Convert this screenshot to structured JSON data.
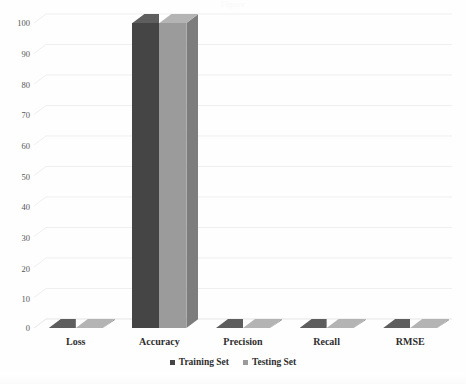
{
  "chart_data": {
    "type": "bar",
    "title": "Figure",
    "xlabel": "",
    "ylabel": "",
    "ylim": [
      0,
      100
    ],
    "ytick_labels": [
      "100",
      "90",
      "80",
      "70",
      "60",
      "50",
      "40",
      "30",
      "20",
      "10",
      "0"
    ],
    "ytick_values": [
      100,
      90,
      80,
      70,
      60,
      50,
      40,
      30,
      20,
      10,
      0
    ],
    "categories": [
      "Loss",
      "Accuracy",
      "Precision",
      "Recall",
      "RMSE"
    ],
    "grid": true,
    "legend_position": "bottom",
    "style": "3d-column",
    "series": [
      {
        "name": "Training Set",
        "color": "#454545",
        "values": [
          0,
          100,
          0,
          0,
          0
        ]
      },
      {
        "name": "Testing Set",
        "color": "#9b9b9b",
        "values": [
          0,
          100,
          0,
          0,
          0
        ]
      }
    ]
  },
  "axis": {
    "y_labels": [
      {
        "text": "100",
        "value": 100
      },
      {
        "text": "90",
        "value": 90
      },
      {
        "text": "80",
        "value": 80
      },
      {
        "text": "70",
        "value": 70
      },
      {
        "text": "60",
        "value": 60
      },
      {
        "text": "50",
        "value": 50
      },
      {
        "text": "40",
        "value": 40
      },
      {
        "text": "30",
        "value": 30
      },
      {
        "text": "20",
        "value": 20
      },
      {
        "text": "10",
        "value": 10
      },
      {
        "text": "0",
        "value": 0
      }
    ],
    "x_labels": [
      "Loss",
      "Accuracy",
      "Precision",
      "Recall",
      "RMSE"
    ]
  },
  "legend": {
    "items": [
      {
        "label": "Training Set",
        "color": "#454545"
      },
      {
        "label": "Testing Set",
        "color": "#9b9b9b"
      }
    ]
  },
  "colors": {
    "training": "#454545",
    "testing": "#9b9b9b",
    "training_top": "#5e5e5e",
    "testing_top": "#b4b4b4",
    "training_side": "#333333",
    "testing_side": "#7d7d7d",
    "gridline": "#efefef",
    "background": "#fefefe",
    "text": "#2e2e2e"
  }
}
